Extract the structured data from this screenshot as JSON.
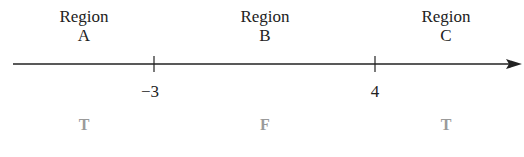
{
  "regions": [
    {
      "name": "Region",
      "letter": "A",
      "truth": "T"
    },
    {
      "name": "Region",
      "letter": "B",
      "truth": "F"
    },
    {
      "name": "Region",
      "letter": "C",
      "truth": "T"
    }
  ],
  "ticks": [
    "−3",
    "4"
  ],
  "colors": {
    "line": "#222222",
    "truth": "#9a9a9a"
  }
}
